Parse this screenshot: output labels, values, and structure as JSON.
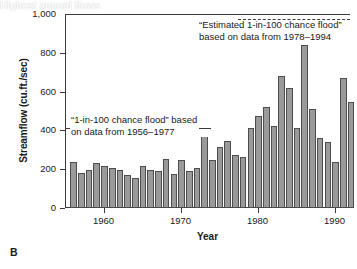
{
  "panel": {
    "letter": "B"
  },
  "chart_data": {
    "type": "bar",
    "title": "",
    "xlabel": "Year",
    "ylabel": "Streamflow (cu.ft./sec)",
    "xlim": [
      1955.5,
      1992.5
    ],
    "ylim": [
      0,
      1000
    ],
    "yticks": [
      0,
      200,
      400,
      600,
      800,
      1000
    ],
    "ytick_labels": [
      "0",
      "200",
      "400",
      "600",
      "800",
      "1,000"
    ],
    "xticks": [
      1960,
      1970,
      1980,
      1990
    ],
    "xtick_labels": [
      "1960",
      "1970",
      "1980",
      "1990"
    ],
    "grid": false,
    "legend": "none",
    "series_name": "Highest annual flows",
    "bar_color": "#9a9a9a",
    "bar_edge_color": "#4d4d4d",
    "categories": [
      "1956",
      "1957",
      "1958",
      "1959",
      "1960",
      "1961",
      "1962",
      "1963",
      "1964",
      "1965",
      "1966",
      "1967",
      "1968",
      "1969",
      "1970",
      "1971",
      "1972",
      "1973",
      "1974",
      "1975",
      "1976",
      "1977",
      "1978",
      "1979",
      "1980",
      "1981",
      "1982",
      "1983",
      "1984",
      "1985",
      "1986",
      "1987",
      "1988",
      "1989",
      "1990",
      "1991",
      "1992"
    ],
    "values": [
      238,
      178,
      198,
      232,
      215,
      206,
      196,
      168,
      153,
      219,
      195,
      189,
      254,
      177,
      245,
      190,
      205,
      414,
      245,
      317,
      344,
      273,
      262,
      412,
      473,
      523,
      421,
      678,
      620,
      410,
      842,
      510,
      360,
      338,
      237,
      672,
      545
    ],
    "extra_values_note": "",
    "annotations": [
      {
        "name": "new-flood-line",
        "text_lines": [
          "“Estimated 1-in-100 chance flood”",
          "based on data from 1978–1994"
        ],
        "line_value": 975,
        "line_style": "dashed",
        "line_x_start": 1978,
        "line_x_end": 1992.5
      },
      {
        "name": "old-flood-line",
        "text_lines": [
          "“1-in-100 chance flood” based",
          "on data from 1956–1977"
        ],
        "line_value": 412,
        "line_style": "solid",
        "line_x_start": 1955.5,
        "line_x_end": 1974.5
      },
      {
        "name": "series-callout",
        "text_lines": [
          "Highest annual flows"
        ]
      }
    ]
  }
}
